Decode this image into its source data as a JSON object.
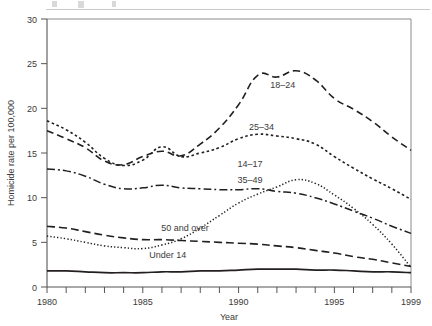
{
  "chart_data": {
    "type": "line",
    "title": "",
    "xlabel": "Year",
    "ylabel": "Homicide rate per 100,000",
    "xlim": [
      1980,
      1999
    ],
    "ylim": [
      0,
      30
    ],
    "ytick_values": [
      0,
      5,
      10,
      15,
      20,
      25,
      30
    ],
    "ytick_labels": [
      "0",
      "5",
      "10",
      "15",
      "20",
      "25",
      "30"
    ],
    "xtick_values": [
      1980,
      1981,
      1982,
      1983,
      1984,
      1985,
      1986,
      1987,
      1988,
      1989,
      1990,
      1991,
      1992,
      1993,
      1994,
      1995,
      1996,
      1997,
      1998,
      1999
    ],
    "xtick_labels": [
      {
        "value": 1980,
        "label": "1980"
      },
      {
        "value": 1985,
        "label": "1985"
      },
      {
        "value": 1990,
        "label": "1990"
      },
      {
        "value": 1995,
        "label": "1995"
      },
      {
        "value": 1999,
        "label": "1999"
      }
    ],
    "grid": false,
    "legend": "inline-labels",
    "x": [
      1980,
      1981,
      1982,
      1983,
      1984,
      1985,
      1986,
      1987,
      1988,
      1989,
      1990,
      1991,
      1992,
      1993,
      1994,
      1995,
      1996,
      1997,
      1998,
      1999
    ],
    "series": [
      {
        "name": "18-24",
        "label": "18–24",
        "linestyle": "dashed",
        "dasharray": "7,4",
        "linewidth": 1.6,
        "values": [
          17.5,
          16.6,
          15.6,
          14.1,
          13.7,
          14.6,
          15.2,
          14.7,
          16.0,
          17.8,
          20.4,
          23.7,
          23.5,
          24.2,
          23.2,
          21.1,
          19.9,
          18.5,
          16.8,
          15.3
        ]
      },
      {
        "name": "25-34",
        "label": "25–34",
        "linestyle": "dotted-coarse",
        "dasharray": "2.6,2.6",
        "linewidth": 1.6,
        "values": [
          18.6,
          17.6,
          16.2,
          14.4,
          13.6,
          14.2,
          15.7,
          14.6,
          15.0,
          15.6,
          16.6,
          17.1,
          16.9,
          16.6,
          16.0,
          14.6,
          13.3,
          12.1,
          11.0,
          9.8
        ]
      },
      {
        "name": "35-49",
        "label": "35–49",
        "linestyle": "dash-dot",
        "dasharray": "8,3,2,3",
        "linewidth": 1.5,
        "values": [
          13.2,
          13.0,
          12.4,
          11.5,
          11.0,
          11.1,
          11.4,
          11.1,
          11.0,
          10.9,
          10.9,
          11.0,
          10.7,
          10.5,
          10.0,
          9.3,
          8.5,
          7.7,
          6.8,
          6.0
        ]
      },
      {
        "name": "14-17",
        "label": "14–17",
        "linestyle": "dotted-fine",
        "dasharray": "1.3,2.1",
        "linewidth": 1.5,
        "values": [
          5.7,
          5.4,
          5.0,
          4.6,
          4.4,
          4.3,
          4.7,
          5.4,
          6.6,
          8.0,
          9.4,
          10.4,
          11.2,
          12.0,
          11.6,
          10.3,
          8.8,
          7.0,
          4.8,
          2.2
        ]
      },
      {
        "name": "50 and over",
        "label": "50 and over",
        "linestyle": "dashed-long",
        "dasharray": "8,4",
        "linewidth": 1.6,
        "values": [
          6.8,
          6.6,
          6.2,
          5.8,
          5.5,
          5.3,
          5.3,
          5.2,
          5.1,
          5.0,
          4.9,
          4.8,
          4.6,
          4.4,
          4.1,
          3.8,
          3.4,
          3.1,
          2.7,
          2.3
        ]
      },
      {
        "name": "Under 14",
        "label": "Under 14",
        "linestyle": "solid",
        "dasharray": "none",
        "linewidth": 1.7,
        "values": [
          1.8,
          1.8,
          1.7,
          1.6,
          1.6,
          1.6,
          1.7,
          1.7,
          1.8,
          1.8,
          1.9,
          2.0,
          2.0,
          2.0,
          1.9,
          1.9,
          1.8,
          1.7,
          1.7,
          1.6
        ]
      }
    ],
    "annotations": [
      {
        "text": "18–24",
        "x": 1992.3,
        "y": 22.3
      },
      {
        "text": "25–34",
        "x": 1991.2,
        "y": 17.6
      },
      {
        "text": "14–17",
        "x": 1990.6,
        "y": 13.4
      },
      {
        "text": "35–49",
        "x": 1990.6,
        "y": 11.6
      },
      {
        "text": "50 and over",
        "x": 1987.2,
        "y": 6.3
      },
      {
        "text": "Under 14",
        "x": 1986.3,
        "y": 3.3
      }
    ]
  }
}
